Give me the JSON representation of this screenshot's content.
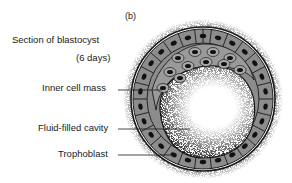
{
  "figure": {
    "panel_label": "(b)",
    "title_line1": "Section of blastocyst",
    "title_line2": "(6 days)",
    "labels": {
      "inner_cell_mass": "Inner cell mass",
      "fluid_cavity": "Fluid-filled cavity",
      "trophoblast": "Trophoblast"
    },
    "colors": {
      "cell_fill": "#8c8c8c",
      "outline": "#1a1a1a",
      "cavity": "#ffffff",
      "background": "#ffffff"
    }
  }
}
